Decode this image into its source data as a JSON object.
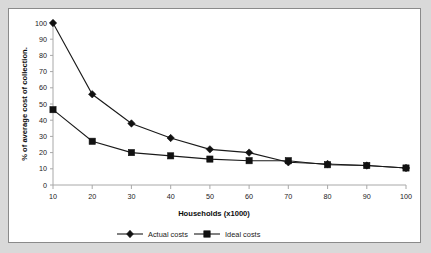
{
  "chart_data": {
    "type": "line",
    "title": "",
    "subtitle": "",
    "xlabel": "Households (x1000)",
    "ylabel": "% of average cost of collection.",
    "x": [
      10,
      20,
      30,
      40,
      50,
      60,
      70,
      80,
      90,
      100
    ],
    "xticklabels": [
      "10",
      "20",
      "30",
      "40",
      "50",
      "60",
      "70",
      "80",
      "90",
      "100"
    ],
    "yticklabels": [
      "0",
      "10",
      "20",
      "30",
      "40",
      "50",
      "60",
      "70",
      "80",
      "90",
      "100"
    ],
    "xlim": [
      10,
      100
    ],
    "ylim": [
      0,
      100
    ],
    "grid": false,
    "legend_position": "bottom",
    "series": [
      {
        "name": "Actual costs",
        "marker": "diamond",
        "color": "#111111",
        "values": [
          100,
          56,
          38,
          29,
          22,
          20,
          14,
          13,
          12,
          10.5
        ]
      },
      {
        "name": "Ideal costs",
        "marker": "square",
        "color": "#111111",
        "values": [
          46.5,
          27,
          20,
          18,
          16,
          15,
          15,
          12.5,
          12,
          10.5
        ]
      }
    ]
  },
  "figure": {
    "background_color": "#ffffff",
    "page_background_color": "#d9d9d9",
    "border_color": "#8a8a8a",
    "axis_color": "#a8a8a8"
  }
}
